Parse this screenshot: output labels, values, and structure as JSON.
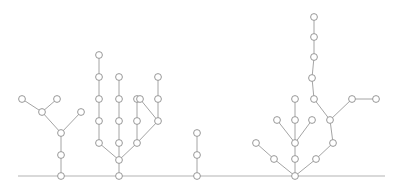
{
  "figure": {
    "width": 399,
    "height": 193,
    "background_color": "#ffffff"
  },
  "style": {
    "edge_color": "#9a9a9a",
    "edge_width": 0.9,
    "node_fill": "#ffffff",
    "node_stroke": "#8d8d8d",
    "node_radius": 3.4,
    "baseline_color": "#b4b4b4",
    "baseline_width": 1.1
  },
  "baseline": {
    "label": "ground-line",
    "y": 176,
    "x_start": 18,
    "x_end": 385
  },
  "chart_data": {
    "type": "scatter",
    "xlabel": "",
    "ylabel": "",
    "grid": false,
    "legend": null,
    "xlim": [
      0,
      399
    ],
    "ylim": [
      193,
      0
    ],
    "baseline_y": 176,
    "tree_count": 4,
    "node_count": 63,
    "trees": [
      {
        "name": "tree-1",
        "root": [
          61,
          176
        ],
        "nodes": [
          [
            61,
            176
          ],
          [
            61,
            155
          ],
          [
            61,
            133
          ],
          [
            42,
            112
          ],
          [
            81,
            112
          ],
          [
            22,
            99
          ],
          [
            57,
            99
          ]
        ],
        "edges": [
          [
            [
              61,
              176
            ],
            [
              61,
              155
            ]
          ],
          [
            [
              61,
              155
            ],
            [
              61,
              133
            ]
          ],
          [
            [
              61,
              133
            ],
            [
              42,
              112
            ]
          ],
          [
            [
              61,
              133
            ],
            [
              81,
              112
            ]
          ],
          [
            [
              42,
              112
            ],
            [
              22,
              99
            ]
          ],
          [
            [
              42,
              112
            ],
            [
              57,
              99
            ]
          ]
        ]
      },
      {
        "name": "tree-2",
        "root": [
          119,
          176
        ],
        "nodes": [
          [
            119,
            176
          ],
          [
            119,
            160
          ],
          [
            99,
            143
          ],
          [
            119,
            143
          ],
          [
            137,
            143
          ],
          [
            99,
            121
          ],
          [
            119,
            121
          ],
          [
            137,
            121
          ],
          [
            158,
            121
          ],
          [
            99,
            99
          ],
          [
            119,
            99
          ],
          [
            137,
            99
          ],
          [
            158,
            99
          ],
          [
            99,
            77
          ],
          [
            119,
            77
          ],
          [
            140,
            99
          ],
          [
            158,
            77
          ],
          [
            99,
            55
          ]
        ],
        "edges": [
          [
            [
              119,
              176
            ],
            [
              119,
              160
            ]
          ],
          [
            [
              119,
              160
            ],
            [
              99,
              143
            ]
          ],
          [
            [
              119,
              160
            ],
            [
              119,
              143
            ]
          ],
          [
            [
              119,
              160
            ],
            [
              137,
              143
            ]
          ],
          [
            [
              99,
              143
            ],
            [
              99,
              121
            ]
          ],
          [
            [
              119,
              143
            ],
            [
              119,
              121
            ]
          ],
          [
            [
              137,
              143
            ],
            [
              158,
              121
            ]
          ],
          [
            [
              137,
              143
            ],
            [
              137,
              121
            ]
          ],
          [
            [
              99,
              121
            ],
            [
              99,
              99
            ]
          ],
          [
            [
              119,
              121
            ],
            [
              119,
              99
            ]
          ],
          [
            [
              137,
              121
            ],
            [
              137,
              99
            ]
          ],
          [
            [
              158,
              121
            ],
            [
              158,
              99
            ]
          ],
          [
            [
              158,
              121
            ],
            [
              140,
              99
            ]
          ],
          [
            [
              99,
              99
            ],
            [
              99,
              77
            ]
          ],
          [
            [
              119,
              99
            ],
            [
              119,
              77
            ]
          ],
          [
            [
              158,
              99
            ],
            [
              158,
              77
            ]
          ],
          [
            [
              99,
              77
            ],
            [
              99,
              55
            ]
          ]
        ]
      },
      {
        "name": "tree-3",
        "root": [
          197,
          176
        ],
        "nodes": [
          [
            197,
            176
          ],
          [
            197,
            155
          ],
          [
            197,
            133
          ]
        ],
        "edges": [
          [
            [
              197,
              176
            ],
            [
              197,
              155
            ]
          ],
          [
            [
              197,
              155
            ],
            [
              197,
              133
            ]
          ]
        ]
      },
      {
        "name": "tree-4",
        "root": [
          295,
          176
        ],
        "nodes": [
          [
            295,
            176
          ],
          [
            274,
            159
          ],
          [
            295,
            159
          ],
          [
            316,
            159
          ],
          [
            256,
            143
          ],
          [
            295,
            143
          ],
          [
            333,
            143
          ],
          [
            277,
            120
          ],
          [
            295,
            120
          ],
          [
            312,
            120
          ],
          [
            295,
            99
          ],
          [
            330,
            120
          ],
          [
            314,
            99
          ],
          [
            352,
            99
          ],
          [
            312,
            78
          ],
          [
            376,
            99
          ],
          [
            314,
            57
          ],
          [
            314,
            37
          ],
          [
            314,
            17
          ]
        ],
        "edges": [
          [
            [
              295,
              176
            ],
            [
              274,
              159
            ]
          ],
          [
            [
              295,
              176
            ],
            [
              295,
              159
            ]
          ],
          [
            [
              295,
              176
            ],
            [
              316,
              159
            ]
          ],
          [
            [
              274,
              159
            ],
            [
              256,
              143
            ]
          ],
          [
            [
              295,
              159
            ],
            [
              295,
              143
            ]
          ],
          [
            [
              316,
              159
            ],
            [
              333,
              143
            ]
          ],
          [
            [
              295,
              143
            ],
            [
              277,
              120
            ]
          ],
          [
            [
              295,
              143
            ],
            [
              295,
              120
            ]
          ],
          [
            [
              295,
              143
            ],
            [
              312,
              120
            ]
          ],
          [
            [
              295,
              120
            ],
            [
              295,
              99
            ]
          ],
          [
            [
              333,
              143
            ],
            [
              330,
              120
            ]
          ],
          [
            [
              330,
              120
            ],
            [
              314,
              99
            ]
          ],
          [
            [
              330,
              120
            ],
            [
              352,
              99
            ]
          ],
          [
            [
              314,
              99
            ],
            [
              312,
              78
            ]
          ],
          [
            [
              352,
              99
            ],
            [
              376,
              99
            ]
          ],
          [
            [
              312,
              78
            ],
            [
              314,
              57
            ]
          ],
          [
            [
              314,
              57
            ],
            [
              314,
              37
            ]
          ],
          [
            [
              314,
              37
            ],
            [
              314,
              17
            ]
          ]
        ]
      }
    ]
  }
}
